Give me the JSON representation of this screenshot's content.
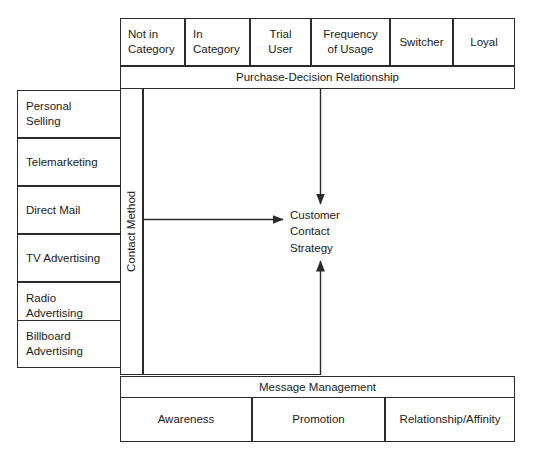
{
  "diagram": {
    "center_label": "Customer\nContact\nStrategy",
    "axis_vertical_label": "Contact Method",
    "band_top_label": "Purchase-Decision Relationship",
    "band_bottom_label": "Message Management",
    "segments_top": [
      {
        "label": "Not in\nCategory"
      },
      {
        "label": "In\nCategory"
      },
      {
        "label": "Trial\nUser"
      },
      {
        "label": "Frequency\nof Usage"
      },
      {
        "label": "Switcher"
      },
      {
        "label": "Loyal"
      }
    ],
    "contact_methods": [
      {
        "label": "Personal\nSelling"
      },
      {
        "label": "Telemarketing"
      },
      {
        "label": "Direct Mail"
      },
      {
        "label": "TV Advertising"
      },
      {
        "label": "Radio\nAdvertising"
      },
      {
        "label": "Billboard\nAdvertising"
      }
    ],
    "message_stages": [
      {
        "label": "Awareness"
      },
      {
        "label": "Promotion"
      },
      {
        "label": "Relationship/Affinity"
      }
    ],
    "colors": {
      "stroke": "#2b2b2b",
      "text": "#1a1a1a",
      "background": "#ffffff"
    }
  }
}
